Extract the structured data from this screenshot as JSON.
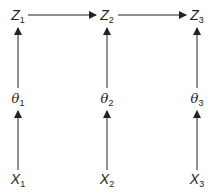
{
  "diagram": {
    "nodes": [
      {
        "id": "Z1",
        "var": "Z",
        "sub": "1",
        "x": 18,
        "y": 17
      },
      {
        "id": "Z2",
        "var": "Z",
        "sub": "2",
        "x": 107,
        "y": 17
      },
      {
        "id": "Z3",
        "var": "Z",
        "sub": "3",
        "x": 197,
        "y": 17
      },
      {
        "id": "theta1",
        "var": "θ",
        "sub": "1",
        "x": 18,
        "y": 100
      },
      {
        "id": "theta2",
        "var": "θ",
        "sub": "2",
        "x": 107,
        "y": 100
      },
      {
        "id": "theta3",
        "var": "θ",
        "sub": "3",
        "x": 197,
        "y": 100
      },
      {
        "id": "X1",
        "var": "X",
        "sub": "1",
        "x": 18,
        "y": 181
      },
      {
        "id": "X2",
        "var": "X",
        "sub": "2",
        "x": 107,
        "y": 181
      },
      {
        "id": "X3",
        "var": "X",
        "sub": "3",
        "x": 197,
        "y": 181
      }
    ],
    "edges": [
      {
        "from": "Z1",
        "to": "Z2"
      },
      {
        "from": "Z2",
        "to": "Z3"
      },
      {
        "from": "theta1",
        "to": "Z1"
      },
      {
        "from": "theta2",
        "to": "Z2"
      },
      {
        "from": "theta3",
        "to": "Z3"
      },
      {
        "from": "X1",
        "to": "theta1"
      },
      {
        "from": "X2",
        "to": "theta2"
      },
      {
        "from": "X3",
        "to": "theta3"
      }
    ],
    "colors": {
      "line": "#222222",
      "text": "#222222"
    }
  }
}
